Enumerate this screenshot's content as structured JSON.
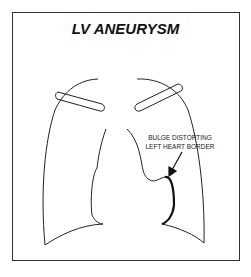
{
  "diagram": {
    "title": "LV ANEURYSM",
    "annotation": {
      "line1": "BULGE DISTORTING",
      "line2": "LEFT HEART BORDER"
    },
    "colors": {
      "stroke": "#222222",
      "background": "#ffffff",
      "border": "#333333"
    }
  }
}
